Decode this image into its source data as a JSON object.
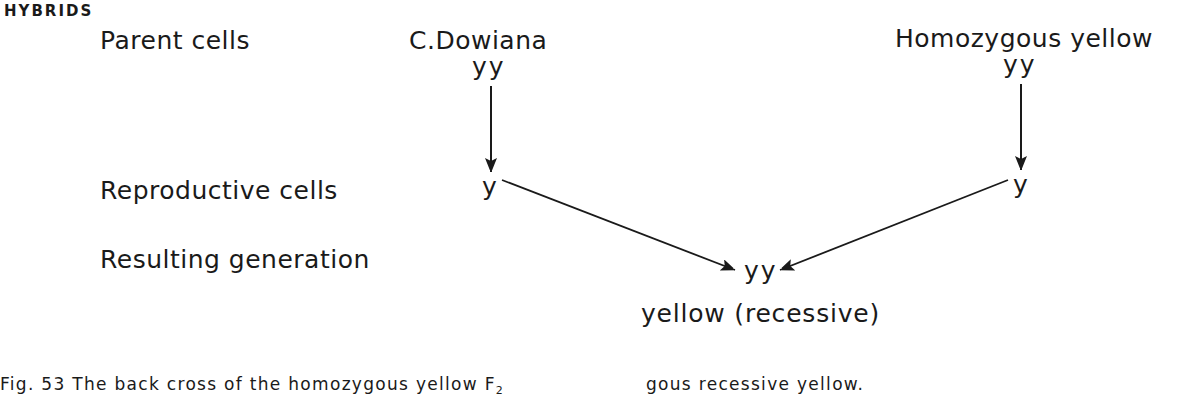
{
  "section_heading": "HYBRIDS",
  "row_labels": {
    "parent_cells": "Parent cells",
    "reproductive_cells": "Reproductive cells",
    "resulting_generation": "Resulting generation"
  },
  "parents": {
    "left": {
      "name": "C.Dowiana",
      "genotype": "yy",
      "gamete": "y"
    },
    "right": {
      "name": "Homozygous yellow",
      "genotype": "yy",
      "gamete": "y"
    }
  },
  "offspring": {
    "genotype": "yy",
    "phenotype": "yellow (recessive)"
  },
  "caption": {
    "left_text": "Fig. 53 The back cross of the homozygous yellow F",
    "left_subscript": "2",
    "right_text": "gous recessive yellow."
  },
  "colors": {
    "ink": "#1a1a1a",
    "background": "#ffffff"
  }
}
